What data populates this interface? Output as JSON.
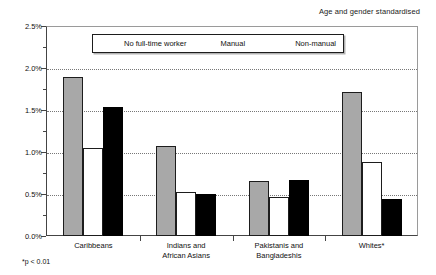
{
  "header": {
    "note": "Age and gender standardised"
  },
  "footnote": "*p < 0.01",
  "legend": {
    "items": [
      {
        "label": "No full-time worker",
        "swatch": "grey-hatched-swatch",
        "color": "#a8a8a8"
      },
      {
        "label": "Manual",
        "swatch": "white-swatch",
        "color": "#ffffff"
      },
      {
        "label": "Non-manual",
        "swatch": "black-swatch",
        "color": "#000000"
      }
    ]
  },
  "axis": {
    "y_ticks": [
      "0.0%",
      "0.5%",
      "1.0%",
      "1.5%",
      "2.0%",
      "2.5%"
    ]
  },
  "chart_data": {
    "type": "bar",
    "title": "",
    "subtitle": "Age and gender standardised",
    "xlabel": "",
    "ylabel": "",
    "ylim": [
      0,
      2.5
    ],
    "ytick_values": [
      0.0,
      0.5,
      1.0,
      1.5,
      2.0,
      2.5
    ],
    "ytick_labels": [
      "0.0%",
      "0.5%",
      "1.0%",
      "1.5%",
      "2.0%",
      "2.5%"
    ],
    "yminor_step": 0.25,
    "grid": "horizontal-dotted",
    "legend_position": "top-inside",
    "annotation": "*p < 0.01",
    "categories": [
      "Caribbeans",
      "Indians and African Asians",
      "Pakistanis and Bangladeshis",
      "Whites*"
    ],
    "category_lines": [
      [
        "Caribbeans"
      ],
      [
        "Indians and",
        "African Asians"
      ],
      [
        "Pakistanis and",
        "Bangladeshis"
      ],
      [
        "Whites*"
      ]
    ],
    "series": [
      {
        "name": "No full-time worker",
        "color": "#a8a8a8",
        "values": [
          1.89,
          1.07,
          0.65,
          1.72
        ]
      },
      {
        "name": "Manual",
        "color": "#ffffff",
        "values": [
          1.05,
          0.52,
          0.47,
          0.88
        ]
      },
      {
        "name": "Non-manual",
        "color": "#000000",
        "values": [
          1.53,
          0.5,
          0.67,
          0.44
        ]
      }
    ]
  }
}
